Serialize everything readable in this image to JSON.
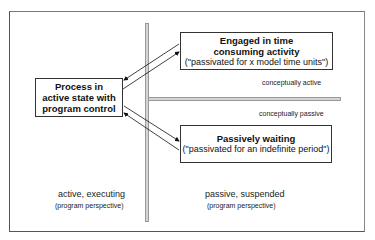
{
  "diagram": {
    "process_box": {
      "lines": [
        "Process in",
        "active state with",
        "program control"
      ]
    },
    "engaged_box": {
      "title_lines": [
        "Engaged in time",
        "consuming activity"
      ],
      "note": "(\"passivated for x model time units\")"
    },
    "waiting_box": {
      "title": "Passively waiting",
      "note": "(\"passivated for an indefinite period\")"
    },
    "region_labels": {
      "conceptually_active": "conceptually active",
      "conceptually_passive": "conceptually passive"
    },
    "perspective_labels": {
      "left_main": "active, executing",
      "left_sub": "(program perspective)",
      "right_main": "passive, suspended",
      "right_sub": "(program perspective)"
    },
    "colors": {
      "frame": "#555555",
      "bar_fill": "#d4d4d4",
      "bar_border": "#999999",
      "box_border": "#333333",
      "text": "#111111"
    }
  }
}
